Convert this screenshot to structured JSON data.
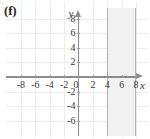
{
  "figure": {
    "panel_label": "(f)",
    "axis_names": {
      "x": "x",
      "y": "y"
    },
    "origin_label": "0"
  },
  "chart_data": {
    "type": "line",
    "title": "",
    "subtitle": "",
    "xlabel": "x",
    "ylabel": "y",
    "xlim": [
      -9,
      9
    ],
    "ylim": [
      -7,
      9
    ],
    "grid": true,
    "legend": "none",
    "x_ticks": [
      -8,
      -6,
      -4,
      -2,
      0,
      2,
      4,
      6,
      8
    ],
    "x_tick_labels": [
      "-8",
      "-6",
      "-4",
      "-2",
      "0",
      "2",
      "4",
      "6",
      "8"
    ],
    "y_ticks": [
      8,
      6,
      4,
      2,
      -2,
      -4,
      -6
    ],
    "y_tick_labels": [
      "8",
      "6",
      "4",
      "2",
      "-2",
      "-4",
      "-6"
    ],
    "annotations": [],
    "series": [
      {
        "name": "boundary-line-x-equals-4",
        "type": "vertical-line",
        "x": 4,
        "style": "solid",
        "color": "#b4b4b4"
      },
      {
        "name": "boundary-line-x-equals-8",
        "type": "vertical-line",
        "x": 8,
        "style": "solid",
        "color": "#b4b4b4"
      }
    ],
    "shaded_regions": [
      {
        "name": "solution-band",
        "orientation": "vertical",
        "x_from": 4,
        "x_to": 8,
        "fill": "#f1f1f1",
        "description": "4 <= x <= 8"
      }
    ]
  },
  "colors": {
    "axis": "#8c8c8c",
    "grid": "#ececec",
    "band_fill": "#f1f1f1",
    "band_edge": "#b4b4b4",
    "text": "#3a3a3a",
    "label": "#262626",
    "background": "#ffffff"
  },
  "tick_labels_x": [
    {
      "value": -8,
      "text": "-8"
    },
    {
      "value": -6,
      "text": "-6"
    },
    {
      "value": -4,
      "text": "-4"
    },
    {
      "value": -2,
      "text": "-2"
    },
    {
      "value": 2,
      "text": "2"
    },
    {
      "value": 4,
      "text": "4"
    },
    {
      "value": 6,
      "text": "6"
    },
    {
      "value": 8,
      "text": "8"
    }
  ],
  "tick_labels_y": [
    {
      "value": 8,
      "text": "8"
    },
    {
      "value": 6,
      "text": "6"
    },
    {
      "value": 4,
      "text": "4"
    },
    {
      "value": 2,
      "text": "2"
    },
    {
      "value": -2,
      "text": "-2"
    },
    {
      "value": -4,
      "text": "-4"
    },
    {
      "value": -6,
      "text": "-6"
    }
  ]
}
